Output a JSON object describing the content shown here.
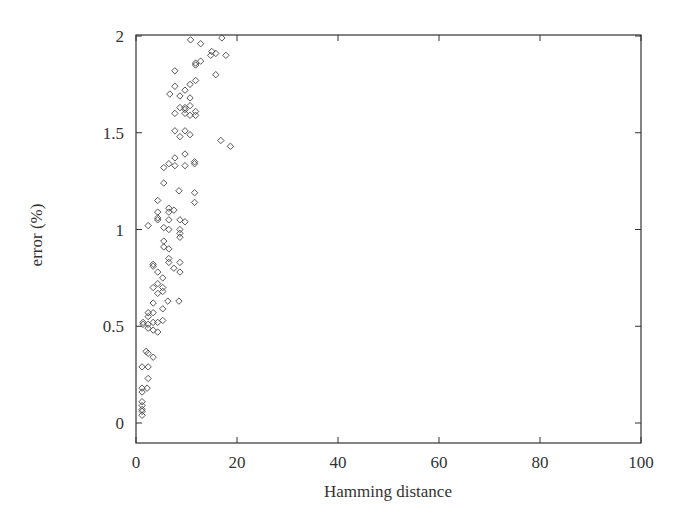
{
  "chart_data": {
    "type": "scatter",
    "title": "",
    "xlabel": "Hamming distance",
    "ylabel": "error (%)",
    "xlim": [
      0,
      100
    ],
    "ylim": [
      -0.1,
      2
    ],
    "xticks": [
      0,
      20,
      40,
      60,
      80,
      100
    ],
    "yticks": [
      0,
      0.5,
      1,
      1.5,
      2
    ],
    "xtick_labels": [
      "0",
      "20",
      "40",
      "60",
      "80",
      "100"
    ],
    "ytick_labels": [
      "0",
      "0.5",
      "1",
      "1.5",
      "2"
    ],
    "grid": false,
    "legend": null,
    "marker": "diamond-open",
    "series": [
      {
        "name": "samples",
        "points": [
          [
            10.8,
            1.98
          ],
          [
            12.8,
            1.96
          ],
          [
            17.0,
            1.99
          ],
          [
            15.0,
            1.92
          ],
          [
            15.8,
            1.91
          ],
          [
            14.8,
            1.9
          ],
          [
            17.8,
            1.9
          ],
          [
            11.8,
            1.86
          ],
          [
            12.8,
            1.87
          ],
          [
            11.8,
            1.85
          ],
          [
            7.7,
            1.82
          ],
          [
            15.8,
            1.8
          ],
          [
            11.8,
            1.77
          ],
          [
            7.7,
            1.74
          ],
          [
            10.7,
            1.75
          ],
          [
            9.7,
            1.72
          ],
          [
            6.7,
            1.7
          ],
          [
            8.7,
            1.69
          ],
          [
            10.7,
            1.68
          ],
          [
            8.7,
            1.63
          ],
          [
            9.7,
            1.63
          ],
          [
            10.7,
            1.64
          ],
          [
            9.7,
            1.62
          ],
          [
            7.7,
            1.6
          ],
          [
            9.7,
            1.6
          ],
          [
            10.7,
            1.59
          ],
          [
            11.8,
            1.61
          ],
          [
            11.8,
            1.59
          ],
          [
            7.7,
            1.51
          ],
          [
            9.7,
            1.51
          ],
          [
            8.7,
            1.48
          ],
          [
            10.7,
            1.49
          ],
          [
            16.8,
            1.46
          ],
          [
            18.7,
            1.43
          ],
          [
            7.7,
            1.37
          ],
          [
            9.7,
            1.39
          ],
          [
            11.6,
            1.35
          ],
          [
            5.5,
            1.32
          ],
          [
            6.5,
            1.34
          ],
          [
            7.7,
            1.33
          ],
          [
            9.7,
            1.33
          ],
          [
            11.6,
            1.34
          ],
          [
            5.5,
            1.24
          ],
          [
            8.5,
            1.2
          ],
          [
            11.6,
            1.19
          ],
          [
            11.6,
            1.14
          ],
          [
            4.3,
            1.15
          ],
          [
            4.3,
            1.09
          ],
          [
            6.5,
            1.11
          ],
          [
            7.5,
            1.1
          ],
          [
            6.5,
            1.09
          ],
          [
            4.3,
            1.06
          ],
          [
            4.3,
            1.05
          ],
          [
            6.5,
            1.05
          ],
          [
            8.7,
            1.05
          ],
          [
            9.7,
            1.04
          ],
          [
            2.4,
            1.02
          ],
          [
            5.5,
            1.01
          ],
          [
            6.5,
            1.0
          ],
          [
            8.7,
            1.0
          ],
          [
            8.7,
            0.98
          ],
          [
            8.7,
            0.96
          ],
          [
            5.5,
            0.94
          ],
          [
            5.5,
            0.91
          ],
          [
            6.5,
            0.9
          ],
          [
            6.5,
            0.85
          ],
          [
            6.5,
            0.83
          ],
          [
            8.7,
            0.83
          ],
          [
            7.5,
            0.8
          ],
          [
            3.4,
            0.81
          ],
          [
            3.4,
            0.82
          ],
          [
            4.3,
            0.78
          ],
          [
            8.7,
            0.78
          ],
          [
            5.3,
            0.75
          ],
          [
            4.3,
            0.72
          ],
          [
            3.4,
            0.7
          ],
          [
            5.3,
            0.7
          ],
          [
            4.3,
            0.67
          ],
          [
            5.3,
            0.68
          ],
          [
            6.3,
            0.63
          ],
          [
            8.5,
            0.63
          ],
          [
            3.4,
            0.62
          ],
          [
            5.3,
            0.59
          ],
          [
            2.4,
            0.57
          ],
          [
            3.4,
            0.57
          ],
          [
            2.4,
            0.55
          ],
          [
            3.4,
            0.52
          ],
          [
            1.4,
            0.52
          ],
          [
            5.3,
            0.53
          ],
          [
            4.3,
            0.52
          ],
          [
            2.4,
            0.51
          ],
          [
            1.4,
            0.51
          ],
          [
            2.4,
            0.49
          ],
          [
            3.4,
            0.48
          ],
          [
            4.3,
            0.47
          ],
          [
            2.0,
            0.37
          ],
          [
            2.4,
            0.36
          ],
          [
            3.4,
            0.34
          ],
          [
            1.2,
            0.29
          ],
          [
            2.4,
            0.29
          ],
          [
            2.4,
            0.23
          ],
          [
            1.2,
            0.18
          ],
          [
            2.2,
            0.18
          ],
          [
            1.2,
            0.16
          ],
          [
            1.2,
            0.11
          ],
          [
            1.2,
            0.09
          ],
          [
            1.2,
            0.07
          ],
          [
            1.2,
            0.06
          ],
          [
            1.2,
            0.04
          ]
        ]
      }
    ]
  },
  "layout": {
    "plot_left": 136,
    "plot_right": 641,
    "plot_top": 35,
    "plot_bottom": 443,
    "y_zero_px": 423,
    "y_two_px": 36
  }
}
